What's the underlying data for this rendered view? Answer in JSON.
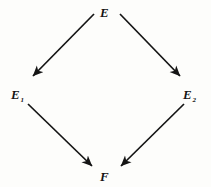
{
  "diagram": {
    "type": "commutative-diamond",
    "background_color": "#fdfdfb",
    "ink_color": "#141414",
    "nodes": [
      {
        "id": "E",
        "base": "E",
        "subscript": "",
        "position": "top",
        "x": 106,
        "y": 11
      },
      {
        "id": "E1",
        "base": "E",
        "subscript": "1",
        "position": "left",
        "x": 17,
        "y": 93
      },
      {
        "id": "E2",
        "base": "E",
        "subscript": "2",
        "position": "right",
        "x": 189,
        "y": 93
      },
      {
        "id": "F",
        "base": "F",
        "subscript": "",
        "position": "bottom",
        "x": 106,
        "y": 175
      }
    ],
    "edges": [
      {
        "id": "E-to-E1",
        "from": "E",
        "to": "E1",
        "x1": 94,
        "y1": 14,
        "x2": 33,
        "y2": 76,
        "arrowhead": "filled-barbed"
      },
      {
        "id": "E-to-E2",
        "from": "E",
        "to": "E2",
        "x1": 120,
        "y1": 14,
        "x2": 180,
        "y2": 76,
        "arrowhead": "filled-barbed"
      },
      {
        "id": "E1-to-F",
        "from": "E1",
        "to": "F",
        "x1": 28,
        "y1": 104,
        "x2": 92,
        "y2": 166,
        "arrowhead": "filled-barbed"
      },
      {
        "id": "E2-to-F",
        "from": "E2",
        "to": "F",
        "x1": 184,
        "y1": 104,
        "x2": 121,
        "y2": 166,
        "arrowhead": "filled-barbed"
      }
    ]
  }
}
